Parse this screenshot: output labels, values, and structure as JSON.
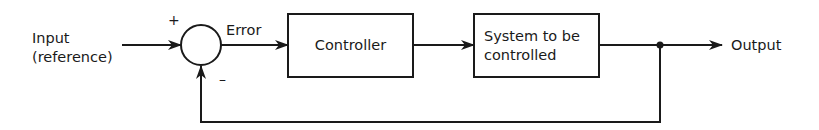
{
  "diagram": {
    "type": "feedback-control-block-diagram",
    "input_label_line1": "Input",
    "input_label_line2": "(reference)",
    "summing_junction": {
      "plus_sign": "+",
      "minus_sign": "–"
    },
    "error_label": "Error",
    "blocks": [
      {
        "id": "controller",
        "lines": [
          "Controller"
        ]
      },
      {
        "id": "system",
        "lines": [
          "System to be",
          "controlled"
        ]
      }
    ],
    "output_label": "Output",
    "connections": [
      {
        "from": "input",
        "to": "summing-junction",
        "sign": "+"
      },
      {
        "from": "summing-junction",
        "to": "controller",
        "label": "Error"
      },
      {
        "from": "controller",
        "to": "system"
      },
      {
        "from": "system",
        "to": "output"
      },
      {
        "from": "output",
        "to": "summing-junction",
        "sign": "-",
        "kind": "feedback"
      }
    ],
    "colors": {
      "stroke": "#1a1a1a",
      "background": "#ffffff"
    }
  }
}
